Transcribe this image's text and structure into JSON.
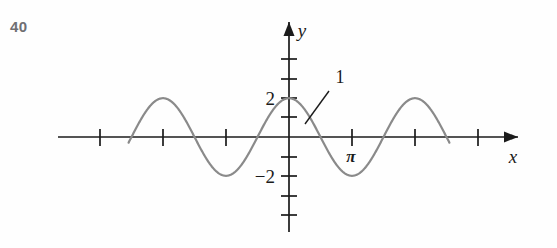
{
  "figure": {
    "exercise_number": "40"
  },
  "labels": {
    "y_axis": "y",
    "x_axis": "x",
    "y_tick_positive": "2",
    "y_tick_negative": "−2",
    "pi_tick": "π",
    "callout": "1"
  },
  "colors": {
    "curve": "#8a8a8a",
    "axis": "#1b1b1b",
    "number_label": "#6e6e72",
    "background": "#fefefe"
  },
  "chart_data": {
    "type": "line",
    "title": "",
    "xlabel": "x",
    "ylabel": "y",
    "function": "y = 2 cos(2x)",
    "amplitude": 2,
    "period": 3.141592653589793,
    "xlim": [
      -5.105088062083414,
      5.105088062083414
    ],
    "ylim": [
      -4.1,
      4.1
    ],
    "grid": false,
    "legend": null,
    "x_ticks": [
      -4.71238898038469,
      -3.141592653589793,
      -1.5707963267948966,
      0,
      1.5707963267948966,
      3.141592653589793,
      4.71238898038469
    ],
    "x_tick_labels": [
      "",
      "",
      "",
      "",
      "",
      "π",
      ""
    ],
    "y_ticks": [
      -4,
      -3,
      -2,
      -1,
      0,
      1,
      2,
      3
    ],
    "y_tick_labels": [
      "",
      "",
      "−2",
      "",
      "",
      "",
      "2",
      ""
    ],
    "annotations": [
      {
        "text": "1",
        "points_to_x": 0.62,
        "points_to_y": -0.55,
        "label_x": 1.36,
        "label_y": 2.45
      }
    ],
    "x": [
      -4.0,
      -3.9,
      -3.8,
      -3.7,
      -3.6,
      -3.5,
      -3.4,
      -3.3,
      -3.2,
      -3.1,
      -3.0,
      -2.9,
      -2.8,
      -2.7,
      -2.6,
      -2.5,
      -2.4,
      -2.3,
      -2.2,
      -2.1,
      -2.0,
      -1.9,
      -1.8,
      -1.7,
      -1.6,
      -1.5,
      -1.4,
      -1.3,
      -1.2,
      -1.1,
      -1.0,
      -0.9,
      -0.8,
      -0.7,
      -0.6,
      -0.5,
      -0.4,
      -0.3,
      -0.2,
      -0.1,
      0.0,
      0.1,
      0.2,
      0.3,
      0.4,
      0.5,
      0.6,
      0.7,
      0.8,
      0.9,
      1.0,
      1.1,
      1.2,
      1.3,
      1.4,
      1.5,
      1.6,
      1.7,
      1.8,
      1.9,
      2.0,
      2.1,
      2.2,
      2.3,
      2.4,
      2.5,
      2.6,
      2.7,
      2.8,
      2.9,
      3.0,
      3.1,
      3.2,
      3.3,
      3.4,
      3.5,
      3.6,
      3.7,
      3.8,
      3.9,
      4.0
    ],
    "y": [
      -1.31,
      -1.67,
      -1.92,
      -2.0,
      -1.92,
      -1.68,
      -1.31,
      -0.85,
      -0.33,
      0.2,
      0.72,
      1.19,
      1.57,
      1.85,
      1.98,
      1.98,
      1.83,
      1.55,
      1.16,
      0.7,
      0.17,
      -0.37,
      -0.88,
      -1.32,
      -1.66,
      -1.88,
      -1.98,
      -1.93,
      -1.75,
      -1.44,
      -1.04,
      -0.56,
      -0.06,
      0.47,
      0.97,
      1.41,
      1.74,
      1.93,
      1.98,
      1.88,
      2.0,
      1.88,
      1.98,
      1.93,
      1.74,
      1.41,
      0.97,
      0.47,
      -0.06,
      -0.56,
      -1.04,
      -1.44,
      -1.75,
      -1.93,
      -1.98,
      -1.88,
      -1.66,
      -1.32,
      -0.88,
      -0.37,
      0.17,
      0.7,
      1.16,
      1.55,
      1.83,
      1.98,
      1.98,
      1.85,
      1.57,
      1.19,
      0.72,
      0.2,
      -0.33,
      -0.85,
      -1.31,
      -1.68,
      -1.92,
      -2.0,
      -1.92,
      -1.67,
      -1.31
    ]
  }
}
